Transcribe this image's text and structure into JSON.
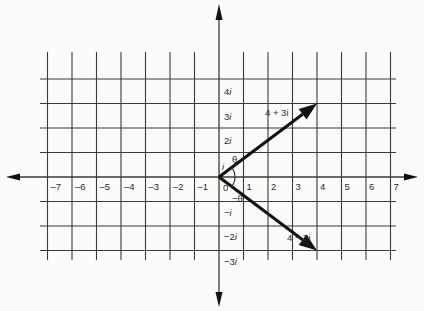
{
  "diagram": {
    "type": "complex-plane",
    "colors": {
      "background": "#fbfbfa",
      "grid": "#3a3a3a",
      "vector": "#111111",
      "text": "#2a2a2a"
    },
    "grid": {
      "x_min": -7,
      "x_max": 7,
      "y_min": -3,
      "y_max": 4,
      "origin_px": [
        219,
        177
      ],
      "unit_px": 24.5
    },
    "real_axis_labels": [
      "-7",
      "-6",
      "-5",
      "-4",
      "-3",
      "-2",
      "-1",
      "0",
      "1",
      "2",
      "3",
      "4",
      "5",
      "6",
      "7"
    ],
    "imag_axis_labels": [
      {
        "value": 4,
        "text": "4i"
      },
      {
        "value": 3,
        "text": "3i"
      },
      {
        "value": 2,
        "text": "2i"
      },
      {
        "value": 1,
        "text": "i"
      },
      {
        "value": -1,
        "text": "−i"
      },
      {
        "value": -2,
        "text": "−2i"
      },
      {
        "value": -3,
        "text": "−3i"
      }
    ],
    "vectors": [
      {
        "name": "z",
        "label": "4 + 3i",
        "to": [
          4,
          3
        ]
      },
      {
        "name": "z-conjugate",
        "label": "4 − 3i",
        "to": [
          4,
          -3
        ]
      }
    ],
    "angles": [
      {
        "label": "θ"
      },
      {
        "label": "−θ"
      }
    ],
    "origin_label": "0"
  }
}
